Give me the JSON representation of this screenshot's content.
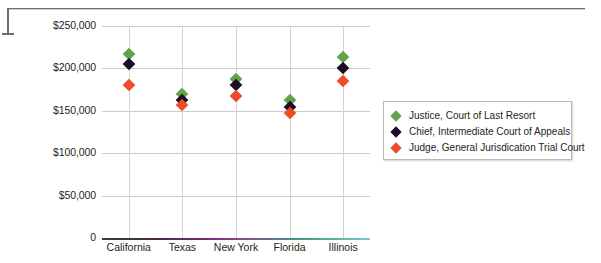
{
  "chart_data": {
    "type": "scatter",
    "title": "",
    "xlabel": "",
    "ylabel": "",
    "categories": [
      "California",
      "Texas",
      "New York",
      "Florida",
      "Illinois"
    ],
    "ylim": [
      0,
      250000
    ],
    "yticks": [
      0,
      50000,
      100000,
      150000,
      200000,
      250000
    ],
    "ytick_labels": [
      "0",
      "$50,000",
      "$100,000",
      "$150,000",
      "$200,000",
      "$250,000"
    ],
    "grid": true,
    "legend_position": "right",
    "series": [
      {
        "name": "Justice, Court of Last Resort",
        "color": "#63a24a",
        "marker": "diamond",
        "values": [
          217000,
          170000,
          187000,
          163000,
          213000
        ]
      },
      {
        "name": "Chief, Intermediate Court of Appeals",
        "color": "#1c0d2b",
        "marker": "diamond",
        "values": [
          205000,
          163000,
          180000,
          155000,
          201000
        ]
      },
      {
        "name": "Judge, General Jurisdication Trial Court",
        "color": "#ef4b28",
        "marker": "diamond",
        "values": [
          180000,
          157000,
          167000,
          147000,
          185000
        ]
      }
    ]
  },
  "legend": {
    "items": [
      {
        "label": "Justice, Court of Last Resort"
      },
      {
        "label": "Chief, Intermediate Court of Appeals"
      },
      {
        "label": "Judge, General Jurisdication Trial Court"
      }
    ]
  },
  "axes": {
    "y_tick_labels": [
      "$250,000",
      "$200,000",
      "$150,000",
      "$100,000",
      "$50,000",
      "0"
    ],
    "x_tick_labels": [
      "California",
      "Texas",
      "New York",
      "Florida",
      "Illinois"
    ]
  },
  "colors": {
    "series_green": "#63a24a",
    "series_black": "#1c0d2b",
    "series_red": "#ef4b28",
    "gridline": "#c9c9c9",
    "frame": "#6d6d6d",
    "text": "#231f20"
  }
}
